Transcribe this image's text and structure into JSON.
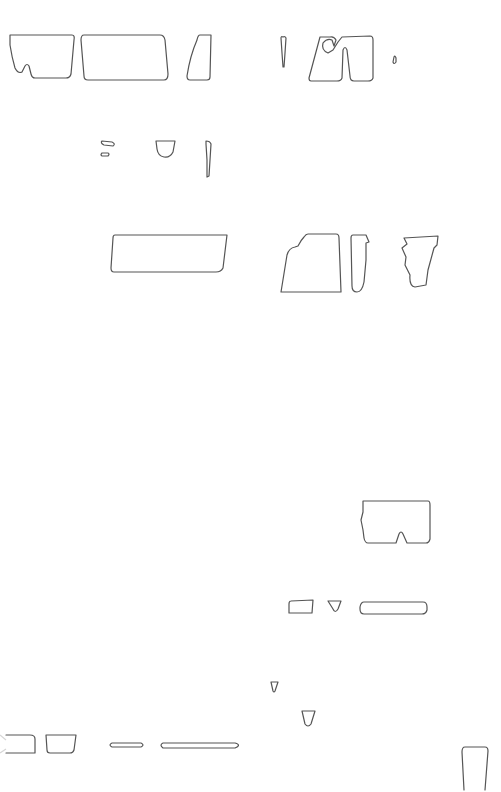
{
  "canvas": {
    "width": 501,
    "height": 792,
    "background": "#ffffff",
    "stroke_color": "#555555"
  },
  "shapes": [
    {
      "name": "outline-shape-1",
      "d": "M10,35 L72,35 Q75,35 74,40 L71,74 Q70,78 66,78 L35,78 Q32,78 31,74 L29,66 Q27,63 25,66 L22,72 Q18,74 15,68 Q12,58 10,45 Z"
    },
    {
      "name": "outline-shape-2",
      "d": "M84,35 L160,35 Q164,35 165,40 L168,74 Q168,80 164,80 L88,80 Q84,80 84,76 L81,40 Q81,35 84,35 Z"
    },
    {
      "name": "outline-shape-3",
      "d": "M200,35 L211,35 L210,77 Q210,80 207,80 L190,80 Q187,80 187,76 Q190,56 197,40 Q198,35 200,35 Z"
    },
    {
      "name": "outline-shape-4",
      "d": "M283,37 Q285,36 286,38 L285,53 L284,67 L283,67 L282,53 L281,38 Q281,36 283,37 Z"
    },
    {
      "name": "outline-shape-5",
      "d": "M320,37 L330,37 Q334,36 336,40 L334,46 L332,40 Q327,38 323,43 Q321,50 328,53 L333,50 L338,42 L342,37 L370,36 Q373,36 373,40 L373,78 Q372,81 368,81 L354,81 Q350,81 350,76 L347,50 Q345,45 343,50 L342,78 Q341,81 337,81 L311,81 Q309,81 309,78 Z"
    },
    {
      "name": "outline-shape-6",
      "d": "M394,57 Q395,55 396,58 L396,62 Q394,65 393,62 Z"
    },
    {
      "name": "outline-shape-7",
      "d": "M102,141 L112,142 Q116,144 113,146 L104,145 Q100,143 102,141 Z"
    },
    {
      "name": "outline-shape-8",
      "d": "M102,153 L108,153 Q110,154 108,156 L102,156 Q100,155 102,153 Z"
    },
    {
      "name": "outline-shape-9",
      "d": "M156,141 L175,141 L173,152 Q170,158 164,157 Q158,156 157,149 Z"
    },
    {
      "name": "outline-shape-10",
      "d": "M206,141 Q210,141 211,144 L210,160 L209,176 L207,177 L207,160 L206,144 Z"
    },
    {
      "name": "outline-shape-11",
      "d": "M115,235 L227,235 L223,268 Q221,272 216,272 L114,272 Q111,272 111,268 L113,238 Q113,235 115,235 Z"
    },
    {
      "name": "outline-shape-12",
      "d": "M308,234 L336,234 Q339,234 339,238 L341,292 L281,292 L287,255 Q289,248 295,247 L298,246 Q301,240 304,237 Q306,234 308,234 Z"
    },
    {
      "name": "outline-shape-13",
      "d": "M353,235 L366,235 L369,242 L366,243 L366,260 L364,282 Q362,292 357,292 Q352,292 352,286 L351,238 Q351,235 353,235 Z"
    },
    {
      "name": "outline-shape-14",
      "d": "M404,238 L438,236 L437,245 L434,248 L428,270 L426,285 L415,287 Q409,286 410,275 L405,265 L406,257 L402,248 L407,244 Z"
    },
    {
      "name": "outline-shape-15",
      "d": "M363,501 L428,501 Q430,501 430,505 L430,539 Q429,543 426,543 L407,543 L403,534 Q401,530 399,534 L396,543 L368,543 Q365,543 364,538 L363,530 L361,520 L363,512 Z"
    },
    {
      "name": "outline-shape-16",
      "d": "M291,601 L313,600 L312,613 L289,613 L289,604 Q289,601 291,601 Z"
    },
    {
      "name": "outline-shape-17",
      "d": "M328,601 L341,601 L338,609 Q335,614 333,609 Z"
    },
    {
      "name": "outline-shape-18",
      "d": "M364,602 L423,602 Q427,602 427,607 L427,610 Q426,614 422,614 L364,614 Q360,614 360,609 L360,607 Q361,602 364,602 Z"
    },
    {
      "name": "outline-shape-19",
      "d": "M271,682 L278,682 L275,691 Q274,693 273,691 Z"
    },
    {
      "name": "outline-shape-20",
      "d": "M302,711 L315,711 L311,724 Q308,728 305,724 Z"
    },
    {
      "name": "outline-shape-21",
      "d": "M6,735 L30,735 Q35,735 35,739 L35,753 L6,753"
    },
    {
      "name": "outline-shape-22",
      "d": "M46,735 L76,735 L74,750 Q73,753 70,753 L50,753 Q47,753 47,750 Z"
    },
    {
      "name": "outline-shape-23",
      "d": "M112,743 L141,743 Q145,745 141,747 L112,747 Q108,745 112,743 Z"
    },
    {
      "name": "outline-shape-24",
      "d": "M163,743 L235,743 Q242,745 235,748 L163,748 Q159,745 163,743 Z"
    },
    {
      "name": "outline-shape-25",
      "d": "M465,747 L485,747 Q488,747 488,751 L485,790 M464,790 L462,752 Q462,747 465,747"
    }
  ],
  "faded_edge": {
    "name": "faded-edge-mark",
    "d": "M0,735 L6,740 M0,753 L6,749"
  }
}
